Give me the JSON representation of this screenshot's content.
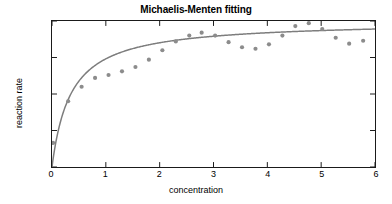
{
  "chart_data": {
    "type": "scatter",
    "title": "Michaelis-Menten fitting",
    "xlabel": "concentration",
    "ylabel": "reaction rate",
    "xlim": [
      0,
      6
    ],
    "ylim": [
      0,
      2
    ],
    "xticks": [
      0,
      1,
      2,
      3,
      4,
      5,
      6
    ],
    "xtick_labels": [
      "0",
      "1",
      "2",
      "3",
      "4",
      "5",
      "6"
    ],
    "yticks": [
      0,
      0.5,
      1,
      1.5,
      2
    ],
    "ytick_labels": [
      "0",
      "0.5",
      "1",
      "1.5",
      "2"
    ],
    "grid": false,
    "legend": null,
    "series": [
      {
        "name": "data",
        "type": "scatter",
        "marker": "filled-circle",
        "color": "#8c8c8c",
        "x": [
          0.02,
          0.3,
          0.55,
          0.8,
          1.05,
          1.3,
          1.55,
          1.8,
          2.05,
          2.3,
          2.55,
          2.78,
          3.03,
          3.28,
          3.53,
          3.78,
          4.03,
          4.28,
          4.52,
          4.77,
          5.02,
          5.27,
          5.52,
          5.78
        ],
        "y": [
          0.33,
          0.9,
          1.1,
          1.22,
          1.26,
          1.31,
          1.37,
          1.47,
          1.6,
          1.72,
          1.8,
          1.84,
          1.8,
          1.71,
          1.64,
          1.62,
          1.68,
          1.8,
          1.93,
          1.97,
          1.89,
          1.77,
          1.69,
          1.73
        ]
      },
      {
        "name": "fit",
        "type": "line",
        "color": "#7d7d7d",
        "model": "Michaelis-Menten",
        "Vmax": 2.0,
        "Km": 0.35
      }
    ]
  }
}
